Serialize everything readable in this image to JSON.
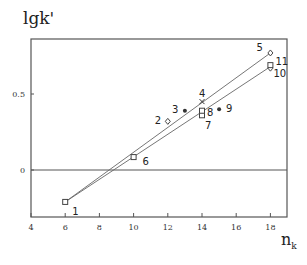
{
  "chart_data": {
    "type": "scatter",
    "title": "",
    "xlabel": "n_k",
    "ylabel": "lgk'",
    "xlim": [
      4,
      19
    ],
    "ylim": [
      -0.31,
      0.86
    ],
    "xticks": [
      4,
      6,
      8,
      10,
      12,
      14,
      16,
      18
    ],
    "yticks": [
      0,
      0.5
    ],
    "ytick_labels": [
      "0",
      "0.5"
    ],
    "hline": 0,
    "grid": false,
    "legend": null,
    "points": [
      {
        "label": "1",
        "x": 6,
        "y": -0.21,
        "marker": "square"
      },
      {
        "label": "2",
        "x": 12,
        "y": 0.32,
        "marker": "diamond"
      },
      {
        "label": "3",
        "x": 13,
        "y": 0.39,
        "marker": "star"
      },
      {
        "label": "4",
        "x": 14,
        "y": 0.45,
        "marker": "cross"
      },
      {
        "label": "5",
        "x": 18,
        "y": 0.77,
        "marker": "diamond"
      },
      {
        "label": "6",
        "x": 10,
        "y": 0.085,
        "marker": "square"
      },
      {
        "label": "7",
        "x": 14,
        "y": 0.36,
        "marker": "square"
      },
      {
        "label": "8",
        "x": 14,
        "y": 0.39,
        "marker": "square"
      },
      {
        "label": "9",
        "x": 15,
        "y": 0.4,
        "marker": "star"
      },
      {
        "label": "10",
        "x": 18,
        "y": 0.67,
        "marker": "diamond"
      },
      {
        "label": "11",
        "x": 18,
        "y": 0.69,
        "marker": "square"
      }
    ],
    "series": [
      {
        "name": "upper line",
        "x": [
          6,
          18
        ],
        "y": [
          -0.21,
          0.77
        ]
      },
      {
        "name": "lower line",
        "x": [
          6,
          18
        ],
        "y": [
          -0.21,
          0.68
        ]
      }
    ]
  }
}
